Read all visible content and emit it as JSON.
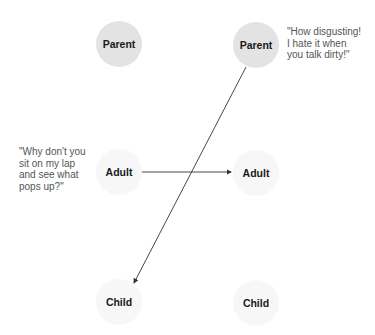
{
  "diagram": {
    "nodes": [
      {
        "id": "parent-left",
        "label": "Parent",
        "cx": 119,
        "cy": 44,
        "style": "parent"
      },
      {
        "id": "parent-right",
        "label": "Parent",
        "cx": 256,
        "cy": 45,
        "style": "parent"
      },
      {
        "id": "adult-left",
        "label": "Adult",
        "cx": 119,
        "cy": 172,
        "style": "faint"
      },
      {
        "id": "adult-right",
        "label": "Adult",
        "cx": 256,
        "cy": 173,
        "style": "faint"
      },
      {
        "id": "child-left",
        "label": "Child",
        "cx": 119,
        "cy": 302,
        "style": "faint"
      },
      {
        "id": "child-right",
        "label": "Child",
        "cx": 256,
        "cy": 303,
        "style": "faint"
      }
    ],
    "quotes": {
      "right": "\"How disgusting!\nI hate it when\nyou talk dirty!\"",
      "left": "\"Why don't you\nsit on my lap\nand see what\npops up?\""
    },
    "arrows": [
      {
        "from": "adult-left",
        "to": "adult-right",
        "x1": 142,
        "y1": 172,
        "x2": 231,
        "y2": 172
      },
      {
        "from": "parent-right",
        "to": "child-left",
        "x1": 246,
        "y1": 67,
        "x2": 134,
        "y2": 283
      }
    ],
    "colors": {
      "line": "#333333",
      "parent_fill": "#e3e3e3",
      "faint_fill": "#f7f7f7"
    }
  }
}
